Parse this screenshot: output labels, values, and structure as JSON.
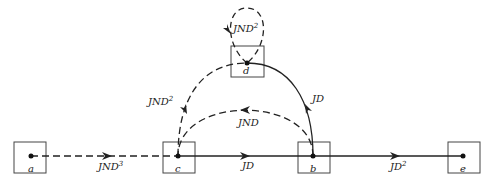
{
  "nodes": [
    {
      "id": "a",
      "label": "a"
    },
    {
      "id": "c",
      "label": "c"
    },
    {
      "id": "d",
      "label": "d"
    },
    {
      "id": "b",
      "label": "b"
    },
    {
      "id": "e",
      "label": "e"
    }
  ],
  "edges": [
    {
      "from": "a",
      "to": "c",
      "label": "JND",
      "exp": "3",
      "style": "dashed"
    },
    {
      "from": "c",
      "to": "b",
      "label": "JD",
      "exp": "",
      "style": "solid"
    },
    {
      "from": "b",
      "to": "e",
      "label": "JD",
      "exp": "2",
      "style": "solid"
    },
    {
      "from": "c",
      "to": "d",
      "label": "JND",
      "exp": "2",
      "style": "dashed"
    },
    {
      "from": "d",
      "to": "b",
      "label": "JD",
      "exp": "",
      "style": "solid"
    },
    {
      "from": "b",
      "to": "c",
      "label": "JND",
      "exp": "",
      "style": "dashed"
    },
    {
      "from": "d",
      "to": "d",
      "label": "JND",
      "exp": "2",
      "style": "dashed"
    }
  ]
}
